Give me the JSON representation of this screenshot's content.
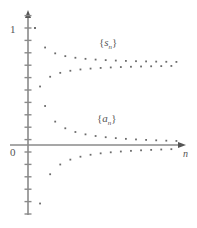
{
  "figure": {
    "background": "#ffffff",
    "axis_color": "#8a8a8a",
    "point_color": "#6b6b6b",
    "text_color": "#555555"
  },
  "axes": {
    "y_label_top": "1",
    "origin_label": "0",
    "x_axis_label": "n",
    "y_tick_count": 16,
    "y_tick_spacing_px": 12.4,
    "x_axis_y_px": 145,
    "y_axis_x_px": 28,
    "x_axis_end_px": 182,
    "y_axis_top_px": 14,
    "y_axis_bottom_px": 215
  },
  "labels": {
    "sequence_terms": "{a_n}",
    "sequence_partial_sums": "{s_n}",
    "a_base": "a",
    "a_sub": "n",
    "s_base": "s",
    "s_sub": "n",
    "brace_open": "{",
    "brace_close": "}"
  },
  "chart_data": {
    "type": "scatter",
    "title": "",
    "xlabel": "n",
    "ylabel": "",
    "grid": false,
    "legend": "inline-annotations",
    "annotations": [
      {
        "text": "{s_n}",
        "x_px": 99,
        "y_px": 36
      },
      {
        "text": "{a_n}",
        "x_px": 97,
        "y_px": 112
      }
    ],
    "ylim": [
      -0.95,
      1.05
    ],
    "xlim": [
      0,
      30
    ],
    "yticks": [
      0,
      1
    ],
    "ytick_labels": [
      "0",
      "1"
    ],
    "series": [
      {
        "name": "{a_n}",
        "description": "alternating harmonic terms a_n = (-1)^(n+1)/n converging to 0",
        "x": [
          1,
          2,
          3,
          4,
          5,
          6,
          7,
          8,
          9,
          10,
          11,
          12,
          13,
          14,
          15,
          16,
          17,
          18,
          19,
          20,
          21,
          22,
          23,
          24,
          25,
          26,
          27,
          28,
          29,
          30
        ],
        "y": [
          1.0,
          -0.5,
          0.3333,
          -0.25,
          0.2,
          -0.1667,
          0.1429,
          -0.125,
          0.1111,
          -0.1,
          0.0909,
          -0.0833,
          0.0769,
          -0.0714,
          0.0667,
          -0.0625,
          0.0588,
          -0.0556,
          0.0526,
          -0.05,
          0.0476,
          -0.0455,
          0.0435,
          -0.0417,
          0.04,
          -0.0385,
          0.037,
          -0.0357,
          0.0345,
          -0.0333
        ]
      },
      {
        "name": "{s_n}",
        "description": "partial sums s_n of the alternating harmonic series converging to ln 2 ≈ 0.693",
        "x": [
          1,
          2,
          3,
          4,
          5,
          6,
          7,
          8,
          9,
          10,
          11,
          12,
          13,
          14,
          15,
          16,
          17,
          18,
          19,
          20,
          21,
          22,
          23,
          24,
          25,
          26,
          27,
          28,
          29,
          30
        ],
        "y": [
          1.0,
          0.5,
          0.8333,
          0.5833,
          0.7833,
          0.6167,
          0.7595,
          0.6345,
          0.7456,
          0.6456,
          0.7365,
          0.6532,
          0.7301,
          0.6587,
          0.7254,
          0.6629,
          0.7217,
          0.6662,
          0.7188,
          0.6688,
          0.7164,
          0.671,
          0.7145,
          0.6728,
          0.7128,
          0.6743,
          0.7113,
          0.6756,
          0.7101,
          0.6768
        ]
      }
    ]
  }
}
